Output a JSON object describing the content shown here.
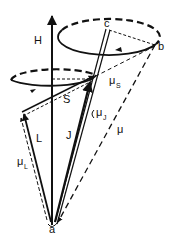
{
  "diagram": {
    "type": "vector-precession",
    "colors": {
      "ink": "#111111",
      "background": "#ffffff"
    },
    "labels": {
      "H": "H",
      "c": "c",
      "b": "b",
      "S": "S",
      "L": "L",
      "J": "J",
      "a": "a",
      "mu": "μ",
      "mu_s_base": "μ",
      "mu_s_sub": "S",
      "mu_j_base": "μ",
      "mu_j_sub": "J",
      "mu_l_base": "μ",
      "mu_l_sub": "L"
    },
    "vectors": [
      {
        "name": "H",
        "style": "solid",
        "from": "a",
        "direction": "vertical-up"
      },
      {
        "name": "J",
        "style": "solid",
        "from": "a",
        "to": "c"
      },
      {
        "name": "S",
        "style": "solid",
        "from": "L-tip",
        "to": "S-tip"
      },
      {
        "name": "L",
        "style": "solid",
        "from": "a",
        "to": "L-tip"
      },
      {
        "name": "μ",
        "style": "dashed",
        "from": "b",
        "to": "a"
      },
      {
        "name": "μL",
        "style": "dashed"
      },
      {
        "name": "μS",
        "style": "dashed"
      },
      {
        "name": "μJ",
        "style": "solid"
      }
    ],
    "precession_orbits": [
      {
        "name": "upper-orbit",
        "around": "J",
        "points": [
          "c",
          "b"
        ]
      },
      {
        "name": "lower-orbit",
        "around": "H"
      }
    ]
  }
}
